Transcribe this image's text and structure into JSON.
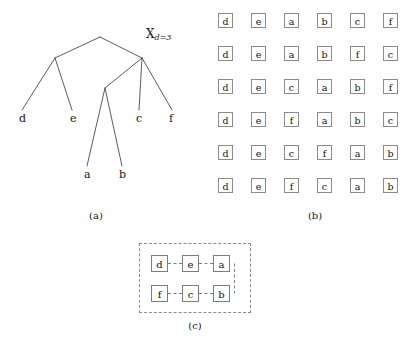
{
  "figure": {
    "panels": [
      {
        "id": "a",
        "caption": "(a)"
      },
      {
        "id": "b",
        "caption": "(b)"
      },
      {
        "id": "c",
        "caption": "(c)"
      }
    ],
    "colors": {
      "stroke": "#4a4a4a",
      "box_border": "#8c8c8c",
      "dashed_border": "#8c8c8c",
      "text": "#161616",
      "background": "#ffffff"
    }
  },
  "panel_a": {
    "caption": "(a)",
    "root_label": "",
    "highlighted_node": {
      "symbol": "X",
      "subscript": "d=3",
      "text": "Xd=3"
    },
    "leaves": [
      {
        "label": "d",
        "x": 19,
        "y": 119
      },
      {
        "label": "e",
        "x": 70,
        "y": 119
      },
      {
        "label": "c",
        "x": 136,
        "y": 119
      },
      {
        "label": "f",
        "x": 169,
        "y": 119
      },
      {
        "label": "a",
        "x": 84,
        "y": 175
      },
      {
        "label": "b",
        "x": 119,
        "y": 175
      }
    ],
    "edges": [
      {
        "from": "root",
        "to": "n-left"
      },
      {
        "from": "root",
        "to": "X"
      },
      {
        "from": "n-left",
        "to": "d"
      },
      {
        "from": "n-left",
        "to": "e"
      },
      {
        "from": "X",
        "to": "n-ab"
      },
      {
        "from": "X",
        "to": "c"
      },
      {
        "from": "X",
        "to": "f"
      },
      {
        "from": "n-ab",
        "to": "a"
      },
      {
        "from": "n-ab",
        "to": "b"
      }
    ]
  },
  "panel_b": {
    "caption": "(b)",
    "rows": [
      [
        "d",
        "e",
        "a",
        "b",
        "c",
        "f"
      ],
      [
        "d",
        "e",
        "a",
        "b",
        "f",
        "c"
      ],
      [
        "d",
        "e",
        "c",
        "a",
        "b",
        "f"
      ],
      [
        "d",
        "e",
        "f",
        "a",
        "b",
        "c"
      ],
      [
        "d",
        "e",
        "c",
        "f",
        "a",
        "b"
      ],
      [
        "d",
        "e",
        "f",
        "c",
        "a",
        "b"
      ]
    ]
  },
  "panel_c": {
    "caption": "(c)",
    "rows": [
      [
        "d",
        "e",
        "a"
      ],
      [
        "f",
        "c",
        "b"
      ]
    ],
    "connectors": "dashed"
  }
}
